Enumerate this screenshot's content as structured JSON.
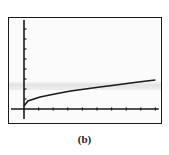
{
  "caption": "(b)",
  "colors": {
    "frame": "#1a1a1a",
    "axis": "#1a1a1a",
    "curve": "#1a1a1a",
    "background": "#fbfbfb"
  },
  "chart_data": {
    "type": "line",
    "title": "",
    "xlabel": "",
    "ylabel": "",
    "caption": "(b)",
    "grid": false,
    "legend": null,
    "xlim": [
      -1,
      9.3
    ],
    "ylim": [
      -1,
      8.9
    ],
    "x_ticks": [
      1,
      2,
      3,
      4,
      5,
      6,
      7,
      8,
      9
    ],
    "y_ticks": [
      1,
      2,
      3,
      4,
      5,
      6,
      7,
      8
    ],
    "tick_labels_shown": false,
    "series": [
      {
        "name": "curve",
        "x": [
          0,
          0.27,
          1.1,
          2.1,
          3.2,
          4.2,
          5.2,
          6.3,
          7.3,
          8.4,
          9.0
        ],
        "y": [
          0.3,
          0.8,
          1.2,
          1.5,
          1.8,
          2.0,
          2.2,
          2.4,
          2.6,
          2.8,
          2.9
        ]
      }
    ]
  }
}
